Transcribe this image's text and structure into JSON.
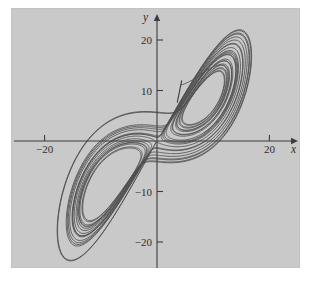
{
  "figure": {
    "background_color": "#ffffff",
    "plot_background_color": "#c9c9c9",
    "curve_color": "#4e4e4e",
    "axis_color": "#3c3c3c"
  },
  "axes": {
    "x_name": "x",
    "y_name": "y",
    "x_ticks": [
      {
        "value": -20,
        "label": "−20"
      },
      {
        "value": 20,
        "label": "20"
      }
    ],
    "y_ticks": [
      {
        "value": 20,
        "label": "20"
      },
      {
        "value": 10,
        "label": "10"
      },
      {
        "value": -10,
        "label": "−10"
      },
      {
        "value": -20,
        "label": "−20"
      }
    ]
  },
  "chart_data": {
    "type": "line",
    "title": "",
    "subtitle": "",
    "xlabel": "x",
    "ylabel": "y",
    "xlim": [
      -26,
      26
    ],
    "ylim": [
      -25,
      26
    ],
    "grid": false,
    "legend": null,
    "annotations": [
      {
        "name": "initial-condition-marker",
        "x": 3.6,
        "y": 7.6,
        "x2": 4.4,
        "y2": 12.0
      }
    ],
    "system": {
      "name": "Lorenz",
      "sigma": 10,
      "rho": 28,
      "beta": 2.6666666667,
      "initial_state": {
        "x": 4.0,
        "y": 11.0,
        "z": 20.0
      },
      "dt": 0.004,
      "steps": 7600,
      "skip": 0
    },
    "series": [
      {
        "name": "trajectory",
        "x": [],
        "y": []
      }
    ]
  }
}
